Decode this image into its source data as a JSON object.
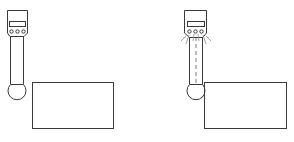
{
  "diagram": {
    "colors": {
      "line": "#3a3a3a",
      "background": "#ffffff",
      "ray": "#8a8a8a"
    },
    "panels": [
      {
        "id": "probe-idle",
        "state": "not-touching",
        "indicator_lights": 3,
        "lights_on": false,
        "center_line": false
      },
      {
        "id": "probe-contact",
        "state": "touching",
        "indicator_lights": 3,
        "lights_on": true,
        "center_line": true
      }
    ]
  }
}
